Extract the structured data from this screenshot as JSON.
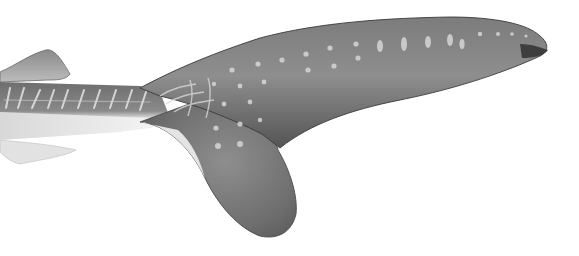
{
  "image": {
    "subject": "shark tail illustration",
    "width": 579,
    "height": 256,
    "background": "#ffffff"
  },
  "colors": {
    "body_dark": "#5e5e5e",
    "body_mid": "#8a8a8a",
    "belly_light": "#e6e6e6",
    "fin_dark": "#6a6a6a",
    "spots": "#d4d4d4",
    "outline": "#3a3a3a"
  }
}
